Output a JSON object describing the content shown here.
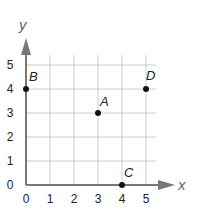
{
  "chart_data": {
    "type": "scatter",
    "title": "",
    "xlabel": "x",
    "ylabel": "y",
    "xlim": [
      0,
      5
    ],
    "ylim": [
      0,
      5
    ],
    "grid": true,
    "x_ticks": [
      "0",
      "1",
      "2",
      "3",
      "4",
      "5"
    ],
    "y_ticks": [
      "0",
      "1",
      "2",
      "3",
      "4",
      "5"
    ],
    "points": [
      {
        "label": "A",
        "x": 3,
        "y": 3
      },
      {
        "label": "B",
        "x": 0,
        "y": 4
      },
      {
        "label": "C",
        "x": 4,
        "y": 0
      },
      {
        "label": "D",
        "x": 5,
        "y": 4
      }
    ]
  },
  "colors": {
    "grid": "#cccccc",
    "axis": "#777777",
    "point": "#111111"
  }
}
